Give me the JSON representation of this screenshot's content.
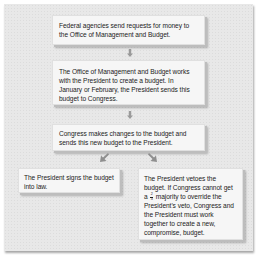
{
  "diagram": {
    "type": "flowchart",
    "colors": {
      "panel_background": "#e8e8e8",
      "box_background": "#f6f6f6",
      "box_shadow": "#bdbdbd",
      "arrow": "#9a9a9a",
      "text": "#1c1c1c"
    },
    "steps": [
      {
        "id": "step1",
        "text": "Federal agencies send requests for money to the Office of Management and Budget."
      },
      {
        "id": "step2",
        "text": "The Office of Management and Budget works with the President to create a budget. In January or February, the President sends this budget to Congress."
      },
      {
        "id": "step3",
        "text": "Congress makes changes to the budget and sends this new budget to the President."
      },
      {
        "id": "outcome_sign",
        "text": "The President signs the budget into law."
      },
      {
        "id": "outcome_veto",
        "text_before_fraction": "The President vetoes the budget. If Congress cannot get a",
        "fraction": {
          "numerator": "2",
          "denominator": "3"
        },
        "text_after_fraction": "majority to override the President's veto, Congress and the President must work together to create a new, compromise, budget."
      }
    ],
    "connections": [
      {
        "from": "step1",
        "to": "step2",
        "direction": "down",
        "icon": "arrow-down-icon"
      },
      {
        "from": "step2",
        "to": "step3",
        "direction": "down",
        "icon": "arrow-down-icon"
      },
      {
        "from": "step3",
        "to": "outcome_sign",
        "direction": "down-left",
        "icon": "arrow-down-left-icon"
      },
      {
        "from": "step3",
        "to": "outcome_veto",
        "direction": "down-right",
        "icon": "arrow-down-right-icon"
      }
    ]
  }
}
